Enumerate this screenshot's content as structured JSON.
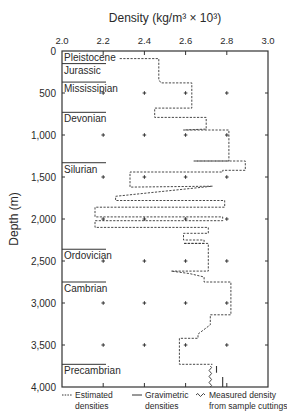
{
  "chart_data": {
    "type": "line",
    "title": "",
    "xlabel": "Density (kg/m³ × 10³)",
    "ylabel": "Depth (m)",
    "xlim": [
      2.0,
      3.0
    ],
    "ylim": [
      4000,
      0
    ],
    "x_ticks": [
      "2.0",
      "2.2",
      "2.4",
      "2.6",
      "2.8",
      "3.0"
    ],
    "x_tick_values": [
      2.0,
      2.2,
      2.4,
      2.6,
      2.8,
      3.0
    ],
    "y_ticks": [
      "0",
      "500",
      "1,000",
      "1,500",
      "2,000",
      "2,500",
      "3,000",
      "3,500",
      "4,000"
    ],
    "y_tick_values": [
      0,
      500,
      1000,
      1500,
      2000,
      2500,
      3000,
      3500,
      4000
    ],
    "grid": "cross markers at tick intersections",
    "legend_position": "bottom",
    "strata": [
      {
        "name": "Pleistocene",
        "top": 0
      },
      {
        "name": "Jurassic",
        "top": 150
      },
      {
        "name": "Mississipian",
        "top": 370
      },
      {
        "name": "Devonian",
        "top": 730
      },
      {
        "name": "Silurian",
        "top": 1330
      },
      {
        "name": "Ordovician",
        "top": 2360
      },
      {
        "name": "Cambrian",
        "top": 2750
      },
      {
        "name": "Precambrian",
        "top": 3730
      }
    ],
    "series": [
      {
        "name": "Estimated densities",
        "style": "dotted",
        "points": [
          [
            2.28,
            90
          ],
          [
            2.47,
            90
          ],
          [
            2.47,
            340
          ],
          [
            2.48,
            380
          ],
          [
            2.63,
            380
          ],
          [
            2.63,
            680
          ],
          [
            2.45,
            680
          ],
          [
            2.45,
            790
          ],
          [
            2.7,
            790
          ],
          [
            2.7,
            930
          ],
          [
            2.59,
            940
          ],
          [
            2.81,
            940
          ],
          [
            2.81,
            1310
          ],
          [
            2.64,
            1310
          ],
          [
            2.89,
            1310
          ],
          [
            2.89,
            1420
          ],
          [
            2.78,
            1420
          ],
          [
            2.78,
            1440
          ],
          [
            2.33,
            1440
          ],
          [
            2.33,
            1620
          ],
          [
            2.73,
            1610
          ],
          [
            2.26,
            1730
          ],
          [
            2.26,
            1780
          ],
          [
            2.79,
            1780
          ],
          [
            2.79,
            1860
          ],
          [
            2.16,
            1860
          ],
          [
            2.16,
            1975
          ],
          [
            2.78,
            1975
          ],
          [
            2.78,
            2020
          ],
          [
            2.16,
            2020
          ],
          [
            2.16,
            2100
          ],
          [
            2.71,
            2100
          ],
          [
            2.71,
            2170
          ],
          [
            2.59,
            2170
          ],
          [
            2.59,
            2250
          ],
          [
            2.69,
            2250
          ],
          [
            2.69,
            2290
          ],
          [
            2.59,
            2290
          ],
          [
            2.71,
            2290
          ],
          [
            2.71,
            2620
          ],
          [
            2.53,
            2620
          ],
          [
            2.62,
            2650
          ],
          [
            2.69,
            2690
          ],
          [
            2.69,
            2750
          ],
          [
            2.82,
            2750
          ],
          [
            2.82,
            3140
          ],
          [
            2.72,
            3140
          ],
          [
            2.72,
            3260
          ],
          [
            2.66,
            3370
          ],
          [
            2.66,
            3420
          ],
          [
            2.57,
            3420
          ],
          [
            2.57,
            3730
          ],
          [
            2.73,
            3730
          ]
        ]
      },
      {
        "name": "Gravimetric densities",
        "style": "solid",
        "points": [
          [
            2.75,
            3750
          ],
          [
            2.75,
            3830
          ],
          [
            2.78,
            3880
          ],
          [
            2.78,
            4000
          ]
        ]
      },
      {
        "name": "Measured density from sample cuttings",
        "style": "wavy",
        "points": [
          [
            2.72,
            3750
          ],
          [
            2.72,
            4000
          ]
        ]
      }
    ],
    "legend": [
      {
        "symbol": "dotted",
        "line1": "Estimated",
        "line2": "densities"
      },
      {
        "symbol": "solid",
        "line1": "Gravimetric",
        "line2": "densities"
      },
      {
        "symbol": "wavy",
        "line1": "Measured density",
        "line2": "from sample cuttings"
      }
    ]
  }
}
